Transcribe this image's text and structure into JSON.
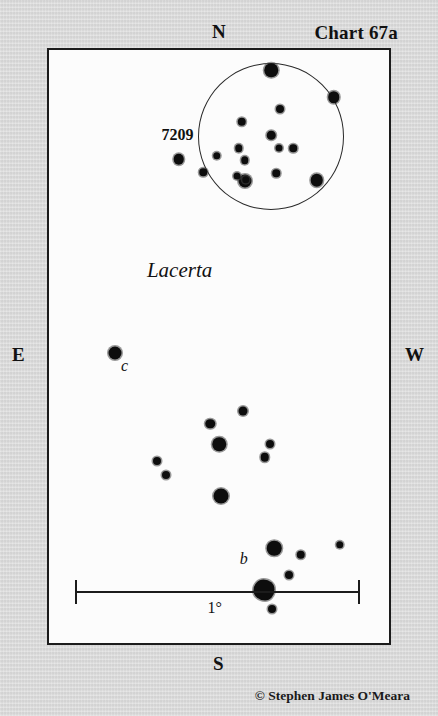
{
  "chart": {
    "title": "Chart 67a",
    "credit": "© Stephen James O'Meara",
    "constellation": "Lacerta",
    "cluster_label": "7209",
    "scale_label": "1°",
    "cardinals": {
      "north": "N",
      "south": "S",
      "east": "E",
      "west": "W"
    },
    "colors": {
      "surround": "#d7d7d7",
      "field": "#fcfcfc",
      "ink": "#0d0d0d",
      "frame": "#1c1c1c"
    }
  },
  "chart_data": {
    "type": "scatter",
    "title": "Chart 67a",
    "subtitle": "Lacerta — open cluster NGC 7209",
    "xlabel": "",
    "ylabel": "",
    "grid": false,
    "legend": null,
    "axis_orientation": {
      "top": "N",
      "bottom": "S",
      "left": "E",
      "right": "W"
    },
    "scale_bar": {
      "label": "1°",
      "x_start_pct": 7.6,
      "x_end_pct": 91.0,
      "y_pct": 91.3
    },
    "cluster_outline": {
      "label": "7209",
      "center_x_pct": 65.4,
      "center_y_pct": 14.6,
      "radius_x_pct": 21.5,
      "radius_y_pct": 12.4
    },
    "annotations": [
      {
        "text": "Lacerta",
        "x_pct": 28.8,
        "y_pct": 35.1,
        "style": "italic"
      },
      {
        "text": "7209",
        "x_pct": 33.1,
        "y_pct": 12.9,
        "style": "bold"
      },
      {
        "text": "c",
        "x_pct": 21.2,
        "y_pct": 51.8,
        "style": "italic"
      },
      {
        "text": "b",
        "x_pct": 56.1,
        "y_pct": 84.4,
        "style": "italic"
      }
    ],
    "points": [
      {
        "x_pct": 65.4,
        "y_pct": 3.4,
        "size": 13.5,
        "label": null
      },
      {
        "x_pct": 83.7,
        "y_pct": 8.0,
        "size": 11.5,
        "label": null
      },
      {
        "x_pct": 38.1,
        "y_pct": 18.4,
        "size": 10.5,
        "label": null
      },
      {
        "x_pct": 57.6,
        "y_pct": 22.1,
        "size": 13.0,
        "label": null
      },
      {
        "x_pct": 78.8,
        "y_pct": 22.0,
        "size": 12.5,
        "label": null
      },
      {
        "x_pct": 68.0,
        "y_pct": 9.9,
        "size": 8.0,
        "label": null
      },
      {
        "x_pct": 56.7,
        "y_pct": 12.1,
        "size": 8.5,
        "label": null
      },
      {
        "x_pct": 65.4,
        "y_pct": 14.4,
        "size": 8.5,
        "label": null
      },
      {
        "x_pct": 67.7,
        "y_pct": 16.5,
        "size": 7.0,
        "label": null
      },
      {
        "x_pct": 71.8,
        "y_pct": 16.6,
        "size": 7.5,
        "label": null
      },
      {
        "x_pct": 49.4,
        "y_pct": 17.8,
        "size": 7.5,
        "label": null
      },
      {
        "x_pct": 55.8,
        "y_pct": 16.6,
        "size": 7.5,
        "label": null
      },
      {
        "x_pct": 57.6,
        "y_pct": 18.6,
        "size": 7.5,
        "label": null
      },
      {
        "x_pct": 45.3,
        "y_pct": 20.6,
        "size": 7.5,
        "label": null
      },
      {
        "x_pct": 55.2,
        "y_pct": 21.3,
        "size": 7.0,
        "label": null
      },
      {
        "x_pct": 57.9,
        "y_pct": 21.9,
        "size": 7.5,
        "label": null
      },
      {
        "x_pct": 66.9,
        "y_pct": 20.8,
        "size": 7.5,
        "label": null
      },
      {
        "x_pct": 19.5,
        "y_pct": 51.1,
        "size": 13.0,
        "label": "c"
      },
      {
        "x_pct": 57.0,
        "y_pct": 60.8,
        "size": 9.0,
        "label": null
      },
      {
        "x_pct": 47.4,
        "y_pct": 63.0,
        "size": 9.5,
        "label": null
      },
      {
        "x_pct": 50.0,
        "y_pct": 66.5,
        "size": 13.5,
        "label": null
      },
      {
        "x_pct": 65.1,
        "y_pct": 66.4,
        "size": 8.0,
        "label": null
      },
      {
        "x_pct": 63.4,
        "y_pct": 68.7,
        "size": 8.5,
        "label": null
      },
      {
        "x_pct": 31.7,
        "y_pct": 69.3,
        "size": 8.0,
        "label": null
      },
      {
        "x_pct": 34.3,
        "y_pct": 71.6,
        "size": 8.0,
        "label": null
      },
      {
        "x_pct": 50.6,
        "y_pct": 75.2,
        "size": 15.0,
        "label": null
      },
      {
        "x_pct": 66.3,
        "y_pct": 84.0,
        "size": 14.5,
        "label": "b"
      },
      {
        "x_pct": 74.1,
        "y_pct": 85.1,
        "size": 8.5,
        "label": null
      },
      {
        "x_pct": 85.5,
        "y_pct": 83.4,
        "size": 7.5,
        "label": null
      },
      {
        "x_pct": 70.6,
        "y_pct": 88.6,
        "size": 8.0,
        "label": null
      },
      {
        "x_pct": 63.1,
        "y_pct": 91.1,
        "size": 21.0,
        "label": null,
        "shape": "blob"
      },
      {
        "x_pct": 65.7,
        "y_pct": 94.3,
        "size": 8.0,
        "label": null
      }
    ]
  }
}
